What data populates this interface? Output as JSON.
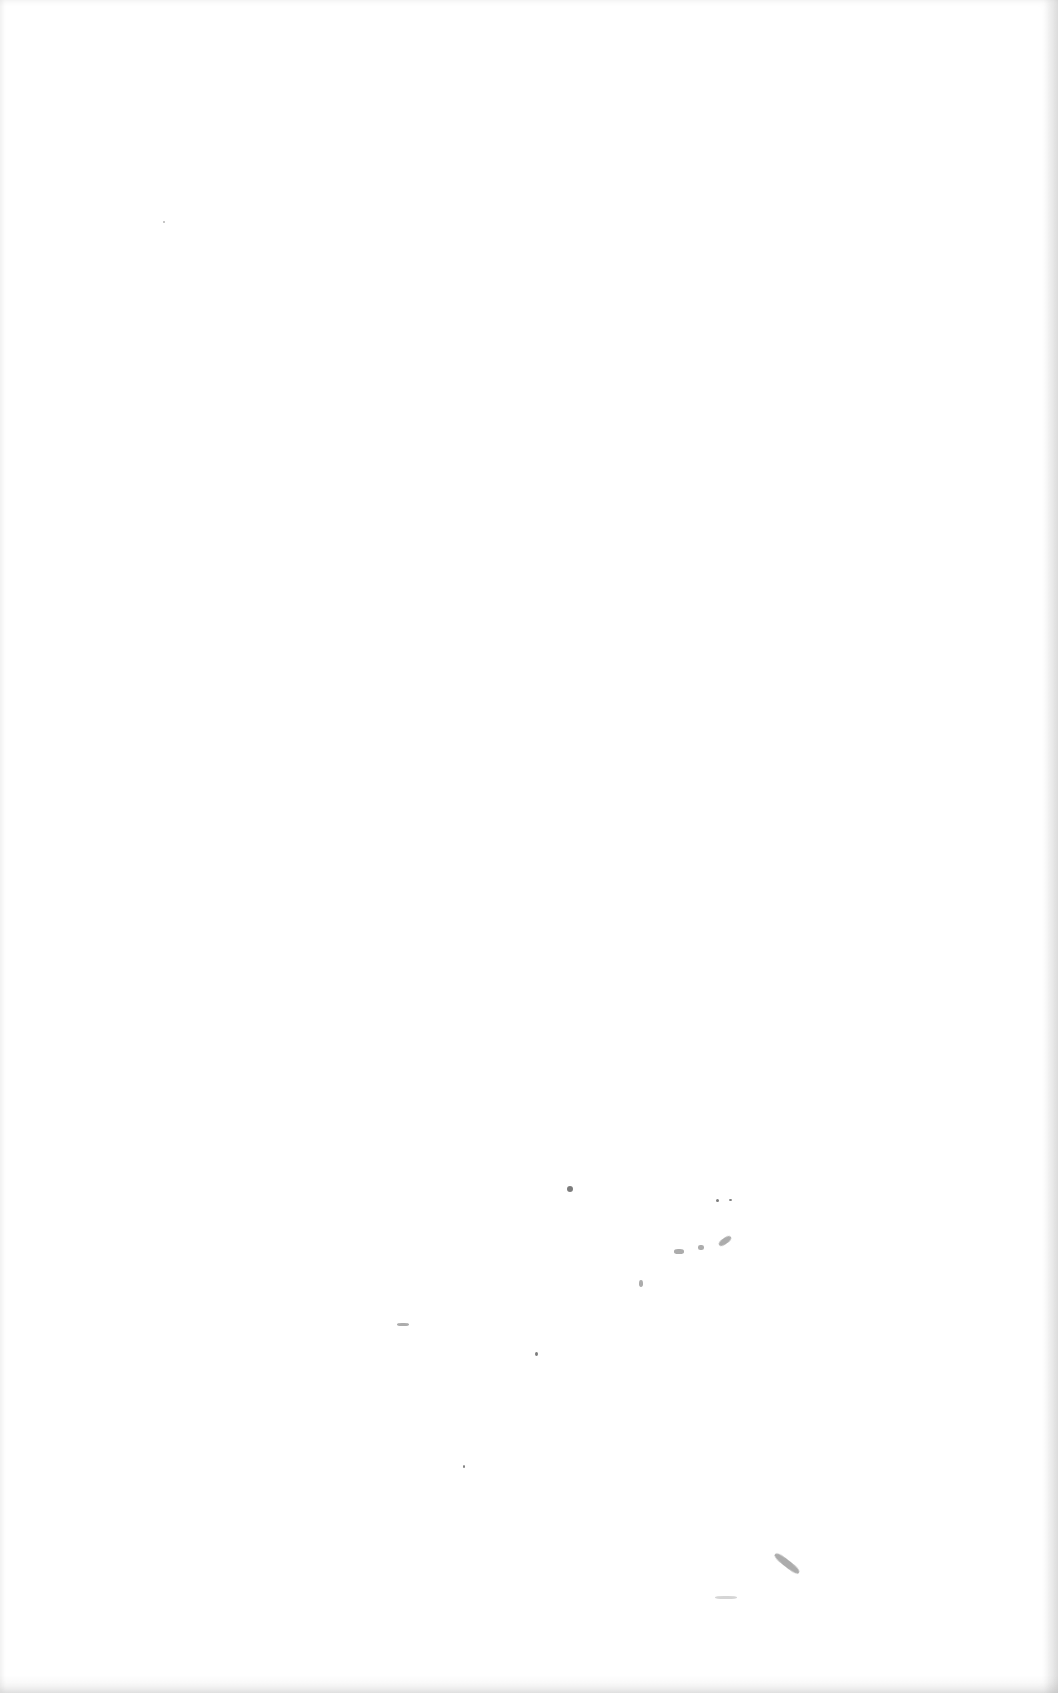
{
  "page": {
    "background": "#ffffff",
    "content": []
  }
}
